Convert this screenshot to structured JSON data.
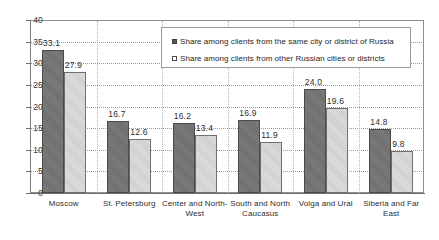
{
  "chart_data": {
    "type": "bar",
    "title": "",
    "subtitle": "",
    "xlabel": "",
    "ylabel": "",
    "ylim": [
      0,
      40
    ],
    "ytick_step": 5,
    "yticks": [
      "40",
      "35",
      "30",
      "25",
      "20",
      "15",
      "10",
      "5",
      "0"
    ],
    "grid": true,
    "legend_position": "top-center-inside",
    "categories": [
      "Moscow",
      "St. Petersburg",
      "Center and North-West",
      "South and North Caucasus",
      "Volga and Ural",
      "Siberia and Far East"
    ],
    "series": [
      {
        "name": "Share among clients from the same city or district of Russia",
        "color": "#6d6d6d",
        "values": [
          33.1,
          16.7,
          16.2,
          16.9,
          24.0,
          14.8
        ],
        "labels": [
          "33.1",
          "16.7",
          "16.2",
          "16.9",
          "24.0",
          "14.8"
        ]
      },
      {
        "name": "Share among clients from other Russian cities or districts",
        "color": "#cdcdcd",
        "values": [
          27.9,
          12.6,
          13.4,
          11.9,
          19.6,
          9.8
        ],
        "labels": [
          "27.9",
          "12.6",
          "13.4",
          "11.9",
          "19.6",
          "9.8"
        ]
      }
    ]
  },
  "legend": {
    "items": [
      {
        "label": "Share among clients from the same city or district of Russia"
      },
      {
        "label": "Share among clients from other Russian cities or districts"
      }
    ]
  }
}
